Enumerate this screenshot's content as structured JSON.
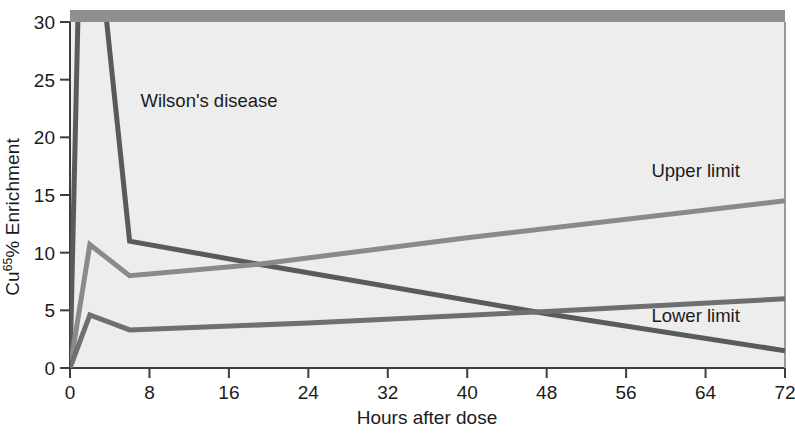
{
  "chart_data": {
    "type": "line",
    "title": "",
    "xlabel": "Hours after dose",
    "ylabel": "Cu65% Enrichment",
    "ylabel_base": "Cu",
    "ylabel_sup": "65",
    "ylabel_tail": "% Enrichment",
    "xlim": [
      0,
      72
    ],
    "ylim": [
      0,
      30
    ],
    "xticks": [
      0,
      8,
      16,
      24,
      32,
      40,
      48,
      56,
      64,
      72
    ],
    "xtick_labels": [
      "0",
      "8",
      "16",
      "24",
      "32",
      "40",
      "48",
      "56",
      "64",
      "72"
    ],
    "yticks": [
      0,
      5,
      10,
      15,
      20,
      25,
      30
    ],
    "ytick_labels": [
      "0",
      "5",
      "10",
      "15",
      "20",
      "25",
      "30"
    ],
    "grid": false,
    "legend_position": "inline-annotations",
    "plot_background": "#ededed",
    "top_band_color": "#8f8f8f",
    "axis_color": "#3d3d3d",
    "series": [
      {
        "name": "Wilson's disease",
        "color": "#5a5a5a",
        "label_x": 14,
        "label_y": 22.6,
        "clipped_above_axis": true,
        "x": [
          0,
          1,
          2,
          6,
          19,
          48,
          72
        ],
        "y": [
          0,
          38,
          44,
          11,
          9,
          4.7,
          1.5
        ],
        "values": [
          0,
          38,
          44,
          11,
          9,
          4.7,
          1.5
        ]
      },
      {
        "name": "Upper limit",
        "color": "#8a8a8a",
        "label_x": 63,
        "label_y": 16.6,
        "clipped_above_axis": false,
        "x": [
          0,
          2,
          6,
          19,
          40,
          72
        ],
        "y": [
          0,
          10.7,
          8.0,
          9.0,
          11.3,
          14.5
        ],
        "values": [
          0,
          10.7,
          8.0,
          9.0,
          11.3,
          14.5
        ]
      },
      {
        "name": "Lower limit",
        "color": "#6f6f6f",
        "label_x": 63,
        "label_y": 4.0,
        "clipped_above_axis": false,
        "x": [
          0,
          2,
          6,
          24,
          48,
          72
        ],
        "y": [
          0,
          4.6,
          3.3,
          3.9,
          4.9,
          6.0
        ],
        "values": [
          0,
          4.6,
          3.3,
          3.9,
          4.9,
          6.0
        ]
      }
    ],
    "annotations": [
      {
        "text": "Wilson's disease",
        "x": 14,
        "y": 22.6
      },
      {
        "text": "Upper limit",
        "x": 63,
        "y": 16.6
      },
      {
        "text": "Lower limit",
        "x": 63,
        "y": 4.0
      }
    ]
  }
}
